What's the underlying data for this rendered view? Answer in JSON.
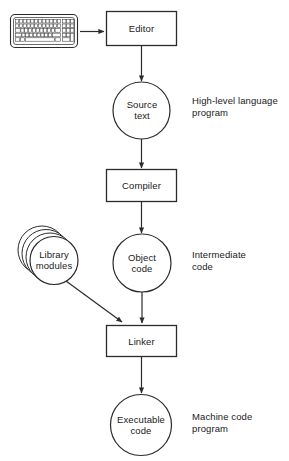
{
  "diagram": {
    "stroke_color": "#2b2b2b",
    "text_color": "#1a1a1a",
    "background": "#ffffff",
    "input_device": {
      "icon": "keyboard-icon",
      "label": ""
    },
    "process_boxes": [
      {
        "id": "editor",
        "label": "Editor"
      },
      {
        "id": "compiler",
        "label": "Compiler"
      },
      {
        "id": "linker",
        "label": "Linker"
      }
    ],
    "data_circles": [
      {
        "id": "source-text",
        "label": "Source\ntext"
      },
      {
        "id": "object-code",
        "label": "Object\ncode"
      },
      {
        "id": "executable-code",
        "label": "Executable\ncode"
      }
    ],
    "stacked_circle": {
      "id": "library-modules",
      "label": "Library\nmodules"
    },
    "annotations": [
      {
        "id": "source-annotation",
        "text": "High-level language\nprogram"
      },
      {
        "id": "object-annotation",
        "text": "Intermediate\ncode"
      },
      {
        "id": "executable-annotation",
        "text": "Machine code\nprogram"
      }
    ]
  }
}
